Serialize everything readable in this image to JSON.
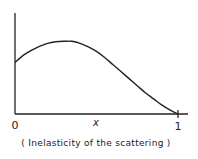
{
  "chart_data": {
    "type": "line",
    "title": "",
    "xlabel": "x",
    "ylabel": "",
    "caption": "( Inelasticity of the scattering )",
    "xlim": [
      0,
      1
    ],
    "ylim": [
      0,
      1
    ],
    "x_ticks": [
      {
        "value": 0,
        "label": "0"
      },
      {
        "value": 1,
        "label": "1"
      }
    ],
    "y_ticks": [],
    "grid": false,
    "legend": null,
    "series": [
      {
        "name": "distribution",
        "x": [
          0,
          0.05,
          0.1,
          0.15,
          0.2,
          0.25,
          0.3,
          0.35,
          0.4,
          0.45,
          0.5,
          0.55,
          0.6,
          0.65,
          0.7,
          0.75,
          0.8,
          0.85,
          0.9,
          0.95,
          1.0
        ],
        "y": [
          0.51,
          0.58,
          0.63,
          0.67,
          0.7,
          0.715,
          0.72,
          0.72,
          0.7,
          0.665,
          0.62,
          0.56,
          0.49,
          0.42,
          0.35,
          0.28,
          0.21,
          0.15,
          0.09,
          0.04,
          0.0
        ]
      }
    ]
  }
}
